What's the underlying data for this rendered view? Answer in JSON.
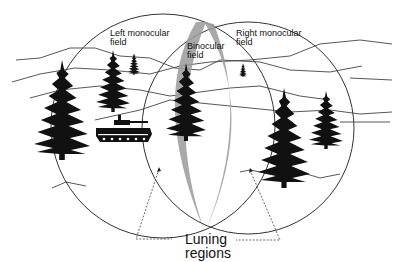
{
  "diagram": {
    "type": "visual-field-illustration",
    "labels": {
      "left_monocular": [
        "Left monocular",
        "field"
      ],
      "binocular": [
        "Binocular",
        "field"
      ],
      "right_monocular": [
        "Right monocular",
        "field"
      ],
      "luning": [
        "Luning",
        "regions"
      ]
    },
    "colors": {
      "line": "#333333",
      "fill_dark": "#111111",
      "luning_gray": "#9a9a9a",
      "background": "#ffffff"
    },
    "elements": {
      "circles": [
        {
          "name": "left-monocular-field",
          "cx": 163,
          "cy": 126,
          "r": 112
        },
        {
          "name": "right-monocular-field",
          "cx": 248,
          "cy": 128,
          "r": 106
        }
      ],
      "trees": [
        {
          "x": 62,
          "base": 160,
          "h": 100,
          "w": 56
        },
        {
          "x": 113,
          "base": 112,
          "h": 62,
          "w": 34
        },
        {
          "x": 134,
          "base": 75,
          "h": 22,
          "w": 12
        },
        {
          "x": 186,
          "base": 141,
          "h": 78,
          "w": 40
        },
        {
          "x": 243,
          "base": 77,
          "h": 14,
          "w": 8
        },
        {
          "x": 284,
          "base": 188,
          "h": 100,
          "w": 52
        },
        {
          "x": 326,
          "base": 149,
          "h": 58,
          "w": 34
        }
      ],
      "vehicle": {
        "name": "tank",
        "x": 96,
        "y": 118
      }
    }
  }
}
